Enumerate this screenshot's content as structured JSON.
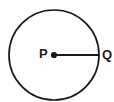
{
  "figure": {
    "type": "geometry-diagram",
    "background_color": "#ffffff",
    "stroke_color": "#1a1a1a",
    "circle": {
      "center_x": 54,
      "center_y": 55,
      "radius": 45,
      "stroke_width": 1.7,
      "fill": "none"
    },
    "center_point": {
      "label": "P",
      "x": 54,
      "y": 55,
      "dot_radius": 3.1,
      "fill": "#1a1a1a"
    },
    "edge_point": {
      "label": "Q",
      "x": 99,
      "y": 55
    },
    "radius_segment": {
      "x1": 54,
      "y1": 55,
      "x2": 99,
      "y2": 55,
      "stroke_width": 1.7
    },
    "labels": {
      "center": "P",
      "edge": "Q"
    }
  }
}
